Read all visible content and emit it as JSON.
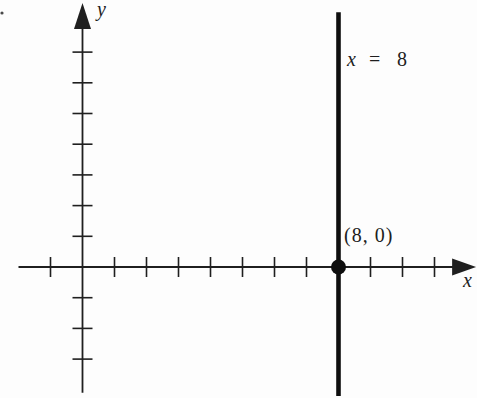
{
  "chart_data": {
    "type": "line",
    "title": "",
    "xlabel": "x",
    "ylabel": "y",
    "x_range": [
      -2,
      12.3
    ],
    "y_range": [
      -4.1,
      8.6
    ],
    "x_ticks": [
      -1,
      1,
      2,
      3,
      4,
      5,
      6,
      7,
      9,
      10,
      11
    ],
    "y_ticks": [
      -3,
      -2,
      -1,
      1,
      2,
      3,
      4,
      5,
      6,
      7
    ],
    "x_tick_step": 1,
    "y_tick_step": 1,
    "grid": false,
    "legend": false,
    "vertical_line": {
      "x": 8,
      "y_extent": [
        -4.2,
        8.3
      ],
      "label": {
        "var": "x",
        "op": "=",
        "value": "8"
      }
    },
    "point": {
      "x": 8,
      "y": 0,
      "label": "(8, 0)"
    },
    "colors": {
      "axis": "#1f1f1f",
      "line": "#0e0e0e",
      "point": "#0e0e0e",
      "background": "#fdfdfd"
    }
  }
}
